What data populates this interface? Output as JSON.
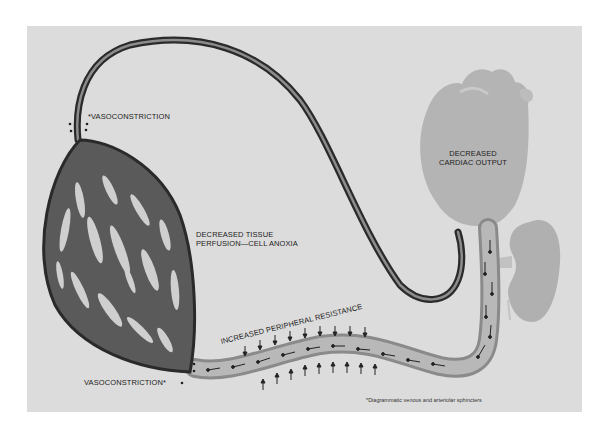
{
  "diagram": {
    "labels": {
      "vasoconstriction_top": "*VASOCONSTRICTION",
      "vasoconstriction_bottom": "VASOCONSTRICTION*",
      "tissue_line1": "DECREASED TISSUE",
      "tissue_line2": "PERFUSION—CELL ANOXIA",
      "cardiac_line1": "DECREASED",
      "cardiac_line2": "CARDIAC OUTPUT",
      "resistance": "INCREASED PERIPHERAL RESISTANCE",
      "footnote": "*Diagrammatic venous and arteriolar sphincters"
    },
    "structures": [
      "capillary-bed",
      "artery",
      "vein",
      "heart",
      "kidney"
    ],
    "colors": {
      "background": "#dcdcdc",
      "vessel_dark": "#2a2a2a",
      "vessel_light": "#a8a8a8",
      "heart": "#b4b4b4",
      "kidney": "#b0b0b0",
      "text": "#222222"
    }
  }
}
